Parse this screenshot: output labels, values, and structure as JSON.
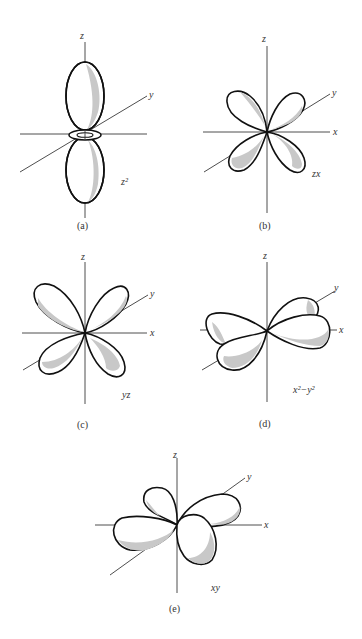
{
  "figure": {
    "panels": [
      {
        "id": "a",
        "caption": "(a)",
        "orbital_label": "z²",
        "axis_labels": {
          "z": "z",
          "y": "y"
        }
      },
      {
        "id": "b",
        "caption": "(b)",
        "orbital_label": "zx",
        "axis_labels": {
          "z": "z",
          "y": "y",
          "x": "x"
        }
      },
      {
        "id": "c",
        "caption": "(c)",
        "orbital_label": "yz",
        "axis_labels": {
          "z": "z",
          "y": "y",
          "x": "x"
        }
      },
      {
        "id": "d",
        "caption": "(d)",
        "orbital_label": "x²−y²",
        "axis_labels": {
          "z": "z",
          "y": "y",
          "x": "x"
        }
      },
      {
        "id": "e",
        "caption": "(e)",
        "orbital_label": "xy",
        "axis_labels": {
          "z": "z",
          "y": "y",
          "x": "x"
        }
      }
    ],
    "colors": {
      "outline": "#111111",
      "shading": "#c8c8c8",
      "axis": "#3a3a3a"
    }
  }
}
